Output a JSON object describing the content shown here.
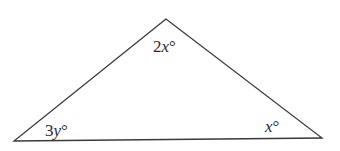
{
  "diagram": {
    "type": "triangle",
    "vertices": {
      "top": [
        166,
        19
      ],
      "bottom_left": [
        14,
        141
      ],
      "bottom_right": [
        322,
        138
      ]
    },
    "angles": {
      "top": {
        "coef": "2",
        "var": "x",
        "unit": "°"
      },
      "bottom_left": {
        "coef": "3",
        "var": "y",
        "unit": "°"
      },
      "bottom_right": {
        "coef": "",
        "var": "x",
        "unit": "°"
      }
    },
    "stroke_color": "#3a3a3a"
  }
}
